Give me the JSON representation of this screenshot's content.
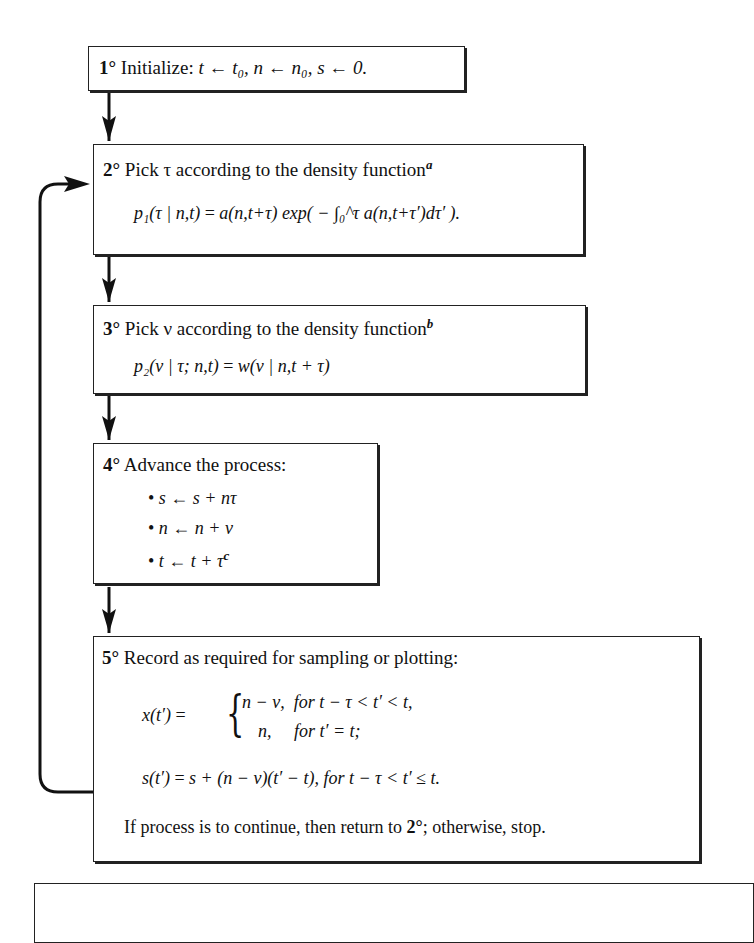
{
  "steps": [
    {
      "number": "1°",
      "text": "Initialize:",
      "formula": "t ← t₀,  n ← n₀,  s ← 0."
    },
    {
      "number": "2°",
      "text": "Pick τ according to the density function",
      "footnote": "a",
      "formula_lhs": "p₁(τ | n,t)",
      "formula_rhs": "a(n,t+τ) exp( − ∫₀^τ a(n,t+τ′)dτ′ )."
    },
    {
      "number": "3°",
      "text": "Pick ν according to the density function",
      "footnote": "b",
      "formula_lhs": "p₂(ν | τ; n,t)",
      "formula_rhs": "w(ν | n,t + τ)"
    },
    {
      "number": "4°",
      "text": "Advance the process:",
      "bullets": [
        "s ← s + nτ",
        "n ← n + ν",
        "t ← t + τ"
      ],
      "footnote": "c"
    },
    {
      "number": "5°",
      "text": "Record as required for sampling or plotting:",
      "x_lhs": "x(t′)",
      "x_case1_value": "n − ν,",
      "x_case1_cond": "for  t − τ < t′ < t,",
      "x_case2_value": "n,",
      "x_case2_cond": "for  t′ = t;",
      "s_lhs": "s(t′)",
      "s_rhs": "s + (n − ν)(t′ − t),  for  t − τ < t′ ≤ t.",
      "continue_text_a": "If process is to continue, then return to ",
      "continue_ref": "2°",
      "continue_text_b": "; otherwise, stop."
    }
  ]
}
